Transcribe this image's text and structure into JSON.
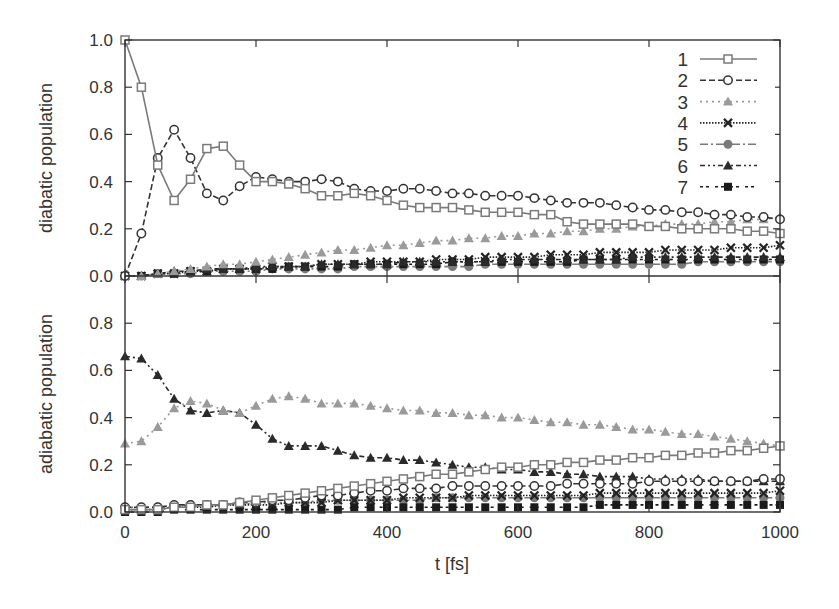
{
  "chart_data": [
    {
      "type": "line",
      "panel": "top",
      "title": "",
      "xlabel": "",
      "ylabel": "diabatic population",
      "xlim": [
        0,
        1000
      ],
      "ylim": [
        0,
        1.0
      ],
      "yticks": [
        "0.0",
        "0.2",
        "0.4",
        "0.6",
        "0.8",
        "1.0"
      ],
      "grid": false,
      "legend_position": "upper right",
      "x": [
        0,
        25,
        50,
        75,
        100,
        125,
        150,
        175,
        200,
        225,
        250,
        275,
        300,
        325,
        350,
        375,
        400,
        425,
        450,
        475,
        500,
        525,
        550,
        575,
        600,
        625,
        650,
        675,
        700,
        725,
        750,
        775,
        800,
        825,
        850,
        875,
        900,
        925,
        950,
        975,
        1000
      ],
      "series": [
        {
          "name": "1",
          "values": [
            1.0,
            0.8,
            0.47,
            0.32,
            0.41,
            0.54,
            0.55,
            0.47,
            0.4,
            0.4,
            0.39,
            0.37,
            0.34,
            0.34,
            0.35,
            0.34,
            0.32,
            0.3,
            0.29,
            0.29,
            0.29,
            0.28,
            0.27,
            0.27,
            0.27,
            0.26,
            0.26,
            0.23,
            0.22,
            0.22,
            0.22,
            0.22,
            0.21,
            0.21,
            0.2,
            0.2,
            0.2,
            0.2,
            0.19,
            0.19,
            0.18
          ]
        },
        {
          "name": "2",
          "values": [
            0.0,
            0.18,
            0.5,
            0.62,
            0.5,
            0.35,
            0.32,
            0.38,
            0.42,
            0.41,
            0.4,
            0.4,
            0.41,
            0.4,
            0.37,
            0.36,
            0.36,
            0.37,
            0.37,
            0.36,
            0.35,
            0.35,
            0.34,
            0.34,
            0.34,
            0.33,
            0.32,
            0.31,
            0.31,
            0.31,
            0.3,
            0.29,
            0.28,
            0.28,
            0.27,
            0.27,
            0.26,
            0.26,
            0.25,
            0.25,
            0.24
          ]
        },
        {
          "name": "3",
          "values": [
            0.0,
            0.0,
            0.01,
            0.02,
            0.03,
            0.04,
            0.05,
            0.05,
            0.06,
            0.07,
            0.08,
            0.09,
            0.1,
            0.11,
            0.11,
            0.12,
            0.13,
            0.13,
            0.14,
            0.15,
            0.15,
            0.16,
            0.16,
            0.17,
            0.17,
            0.18,
            0.18,
            0.19,
            0.19,
            0.2,
            0.2,
            0.21,
            0.21,
            0.22,
            0.22,
            0.22,
            0.23,
            0.23,
            0.24,
            0.24,
            0.25
          ]
        },
        {
          "name": "4",
          "values": [
            0.0,
            0.0,
            0.01,
            0.01,
            0.02,
            0.02,
            0.03,
            0.03,
            0.03,
            0.04,
            0.04,
            0.04,
            0.05,
            0.05,
            0.05,
            0.06,
            0.06,
            0.06,
            0.06,
            0.07,
            0.07,
            0.07,
            0.08,
            0.08,
            0.08,
            0.08,
            0.09,
            0.09,
            0.09,
            0.1,
            0.1,
            0.1,
            0.1,
            0.11,
            0.11,
            0.11,
            0.11,
            0.12,
            0.12,
            0.12,
            0.13
          ]
        },
        {
          "name": "5",
          "values": [
            0.0,
            0.0,
            0.01,
            0.01,
            0.01,
            0.02,
            0.02,
            0.02,
            0.02,
            0.03,
            0.03,
            0.03,
            0.03,
            0.03,
            0.04,
            0.04,
            0.04,
            0.04,
            0.04,
            0.04,
            0.04,
            0.04,
            0.05,
            0.05,
            0.05,
            0.05,
            0.05,
            0.05,
            0.05,
            0.05,
            0.05,
            0.05,
            0.05,
            0.05,
            0.05,
            0.06,
            0.06,
            0.06,
            0.06,
            0.06,
            0.06
          ]
        },
        {
          "name": "6",
          "values": [
            0.0,
            0.0,
            0.01,
            0.02,
            0.02,
            0.03,
            0.03,
            0.03,
            0.04,
            0.04,
            0.04,
            0.04,
            0.05,
            0.05,
            0.05,
            0.05,
            0.05,
            0.06,
            0.06,
            0.06,
            0.06,
            0.06,
            0.06,
            0.07,
            0.07,
            0.07,
            0.07,
            0.07,
            0.07,
            0.07,
            0.07,
            0.08,
            0.08,
            0.08,
            0.08,
            0.08,
            0.08,
            0.08,
            0.08,
            0.08,
            0.08
          ]
        },
        {
          "name": "7",
          "values": [
            0.0,
            0.0,
            0.01,
            0.01,
            0.02,
            0.02,
            0.03,
            0.03,
            0.03,
            0.03,
            0.04,
            0.04,
            0.04,
            0.04,
            0.05,
            0.05,
            0.05,
            0.05,
            0.05,
            0.05,
            0.06,
            0.06,
            0.06,
            0.06,
            0.06,
            0.06,
            0.06,
            0.06,
            0.07,
            0.07,
            0.07,
            0.07,
            0.07,
            0.07,
            0.07,
            0.07,
            0.07,
            0.07,
            0.07,
            0.07,
            0.07
          ]
        }
      ]
    },
    {
      "type": "line",
      "panel": "bottom",
      "title": "",
      "xlabel": "t [fs]",
      "ylabel": "adiabatic population",
      "xlim": [
        0,
        1000
      ],
      "ylim": [
        0,
        1.0
      ],
      "xticks": [
        "0",
        "200",
        "400",
        "600",
        "800",
        "1000"
      ],
      "yticks": [
        "0.0",
        "0.2",
        "0.4",
        "0.6",
        "0.8"
      ],
      "grid": false,
      "x": [
        0,
        25,
        50,
        75,
        100,
        125,
        150,
        175,
        200,
        225,
        250,
        275,
        300,
        325,
        350,
        375,
        400,
        425,
        450,
        475,
        500,
        525,
        550,
        575,
        600,
        625,
        650,
        675,
        700,
        725,
        750,
        775,
        800,
        825,
        850,
        875,
        900,
        925,
        950,
        975,
        1000
      ],
      "series": [
        {
          "name": "1",
          "values": [
            0.01,
            0.01,
            0.01,
            0.02,
            0.02,
            0.03,
            0.03,
            0.04,
            0.05,
            0.06,
            0.07,
            0.08,
            0.09,
            0.1,
            0.11,
            0.12,
            0.13,
            0.14,
            0.15,
            0.16,
            0.16,
            0.17,
            0.18,
            0.19,
            0.19,
            0.2,
            0.2,
            0.21,
            0.21,
            0.22,
            0.22,
            0.23,
            0.23,
            0.24,
            0.24,
            0.25,
            0.25,
            0.26,
            0.26,
            0.27,
            0.28
          ]
        },
        {
          "name": "2",
          "values": [
            0.02,
            0.02,
            0.02,
            0.03,
            0.03,
            0.03,
            0.03,
            0.04,
            0.04,
            0.05,
            0.05,
            0.06,
            0.07,
            0.07,
            0.08,
            0.09,
            0.09,
            0.1,
            0.1,
            0.1,
            0.11,
            0.11,
            0.11,
            0.11,
            0.11,
            0.11,
            0.11,
            0.12,
            0.12,
            0.12,
            0.12,
            0.12,
            0.13,
            0.13,
            0.13,
            0.13,
            0.13,
            0.13,
            0.13,
            0.14,
            0.14
          ]
        },
        {
          "name": "3",
          "values": [
            0.29,
            0.3,
            0.36,
            0.44,
            0.47,
            0.46,
            0.43,
            0.42,
            0.45,
            0.48,
            0.49,
            0.48,
            0.46,
            0.46,
            0.46,
            0.45,
            0.44,
            0.43,
            0.43,
            0.42,
            0.42,
            0.41,
            0.41,
            0.4,
            0.4,
            0.39,
            0.38,
            0.38,
            0.37,
            0.37,
            0.36,
            0.35,
            0.35,
            0.34,
            0.33,
            0.33,
            0.32,
            0.31,
            0.3,
            0.29,
            0.28
          ]
        },
        {
          "name": "4",
          "values": [
            0.01,
            0.01,
            0.01,
            0.02,
            0.02,
            0.02,
            0.03,
            0.03,
            0.03,
            0.03,
            0.04,
            0.04,
            0.04,
            0.05,
            0.05,
            0.05,
            0.05,
            0.06,
            0.06,
            0.06,
            0.06,
            0.07,
            0.07,
            0.07,
            0.07,
            0.07,
            0.07,
            0.07,
            0.07,
            0.08,
            0.08,
            0.08,
            0.08,
            0.08,
            0.08,
            0.08,
            0.08,
            0.08,
            0.08,
            0.08,
            0.09
          ]
        },
        {
          "name": "5",
          "values": [
            0.02,
            0.02,
            0.02,
            0.02,
            0.03,
            0.03,
            0.03,
            0.03,
            0.04,
            0.04,
            0.04,
            0.04,
            0.05,
            0.05,
            0.05,
            0.05,
            0.05,
            0.05,
            0.05,
            0.06,
            0.06,
            0.06,
            0.06,
            0.06,
            0.06,
            0.06,
            0.06,
            0.06,
            0.06,
            0.06,
            0.06,
            0.06,
            0.06,
            0.06,
            0.06,
            0.06,
            0.06,
            0.06,
            0.06,
            0.06,
            0.06
          ]
        },
        {
          "name": "6",
          "values": [
            0.66,
            0.65,
            0.58,
            0.48,
            0.43,
            0.42,
            0.43,
            0.42,
            0.37,
            0.31,
            0.28,
            0.28,
            0.28,
            0.26,
            0.24,
            0.23,
            0.23,
            0.22,
            0.22,
            0.21,
            0.2,
            0.19,
            0.19,
            0.18,
            0.18,
            0.17,
            0.17,
            0.16,
            0.16,
            0.15,
            0.15,
            0.15,
            0.14,
            0.14,
            0.14,
            0.14,
            0.13,
            0.13,
            0.13,
            0.13,
            0.13
          ]
        },
        {
          "name": "7",
          "values": [
            0.0,
            0.0,
            0.0,
            0.01,
            0.01,
            0.01,
            0.01,
            0.01,
            0.01,
            0.01,
            0.01,
            0.01,
            0.01,
            0.01,
            0.02,
            0.02,
            0.02,
            0.02,
            0.02,
            0.02,
            0.02,
            0.02,
            0.02,
            0.02,
            0.02,
            0.02,
            0.02,
            0.02,
            0.02,
            0.03,
            0.03,
            0.03,
            0.03,
            0.03,
            0.03,
            0.03,
            0.03,
            0.03,
            0.03,
            0.03,
            0.03
          ]
        }
      ]
    }
  ],
  "legend": [
    {
      "label": "1",
      "marker": "square-open",
      "dash": "solid",
      "color": "#7a7a7a"
    },
    {
      "label": "2",
      "marker": "circle-open",
      "dash": "6,3",
      "color": "#333333"
    },
    {
      "label": "3",
      "marker": "triangle-filled",
      "dash": "2,4",
      "color": "#9a9a9a"
    },
    {
      "label": "4",
      "marker": "x-cross",
      "dash": "1.5,1.5",
      "color": "#222222"
    },
    {
      "label": "5",
      "marker": "circle-filled",
      "dash": "8,3,2,3",
      "color": "#7a7a7a"
    },
    {
      "label": "6",
      "marker": "triangle-filled",
      "dash": "5,3,2,3,2,3",
      "color": "#2a2a2a"
    },
    {
      "label": "7",
      "marker": "square-filled",
      "dash": "3,3,3,6",
      "color": "#1a1a1a"
    }
  ],
  "axes": {
    "top_ylabel": "diabatic population",
    "bottom_ylabel": "adiabatic population",
    "xlabel": "t [fs]",
    "xticks": [
      "0",
      "200",
      "400",
      "600",
      "800",
      "1000"
    ],
    "top_yticks": [
      "0.0",
      "0.2",
      "0.4",
      "0.6",
      "0.8",
      "1.0"
    ],
    "bottom_yticks": [
      "0.0",
      "0.2",
      "0.4",
      "0.6",
      "0.8"
    ]
  }
}
